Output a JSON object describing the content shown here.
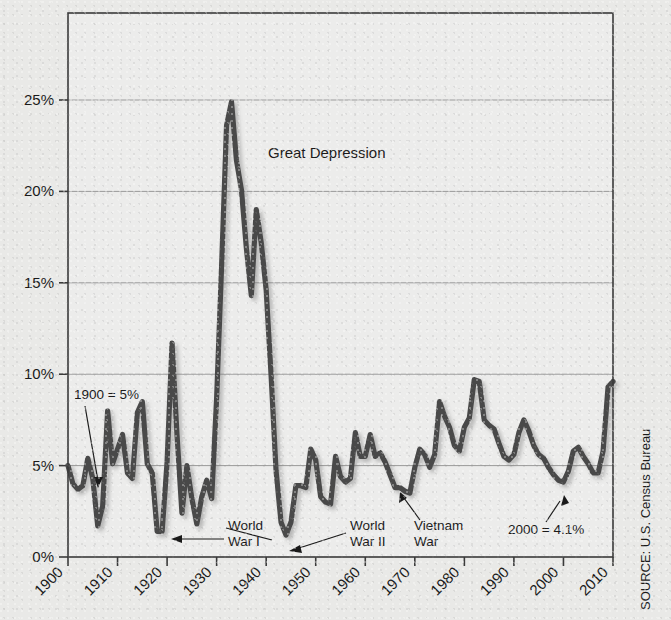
{
  "chart_data": {
    "type": "line",
    "title": "",
    "xlabel": "",
    "ylabel": "",
    "xlim": [
      1900,
      2010
    ],
    "ylim": [
      0,
      28.5
    ],
    "grid": true,
    "legend_position": "none",
    "y_tick_labels": [
      "0%",
      "5%",
      "10%",
      "15%",
      "20%",
      "25%"
    ],
    "y_tick_values": [
      0,
      5,
      10,
      15,
      20,
      25
    ],
    "x_tick_labels": [
      "1900",
      "1910",
      "1920",
      "1930",
      "1940",
      "1950",
      "1960",
      "1970",
      "1980",
      "1990",
      "2000",
      "2010"
    ],
    "x_tick_values": [
      1900,
      1910,
      1920,
      1930,
      1940,
      1950,
      1960,
      1970,
      1980,
      1990,
      2000,
      2010
    ],
    "series_name": "Unemployment rate",
    "series_color": "#4a4a4a",
    "x": [
      1900,
      1901,
      1902,
      1903,
      1904,
      1905,
      1906,
      1907,
      1908,
      1909,
      1910,
      1911,
      1912,
      1913,
      1914,
      1915,
      1916,
      1917,
      1918,
      1919,
      1920,
      1921,
      1922,
      1923,
      1924,
      1925,
      1926,
      1927,
      1928,
      1929,
      1930,
      1931,
      1932,
      1933,
      1934,
      1935,
      1936,
      1937,
      1938,
      1939,
      1940,
      1941,
      1942,
      1943,
      1944,
      1945,
      1946,
      1947,
      1948,
      1949,
      1950,
      1951,
      1952,
      1953,
      1954,
      1955,
      1956,
      1957,
      1958,
      1959,
      1960,
      1961,
      1962,
      1963,
      1964,
      1965,
      1966,
      1967,
      1968,
      1969,
      1970,
      1971,
      1972,
      1973,
      1974,
      1975,
      1976,
      1977,
      1978,
      1979,
      1980,
      1981,
      1982,
      1983,
      1984,
      1985,
      1986,
      1987,
      1988,
      1989,
      1990,
      1991,
      1992,
      1993,
      1994,
      1995,
      1996,
      1997,
      1998,
      1999,
      2000,
      2001,
      2002,
      2003,
      2004,
      2005,
      2006,
      2007,
      2008,
      2009,
      2010
    ],
    "values": [
      5.0,
      4.0,
      3.7,
      3.9,
      5.4,
      4.3,
      1.7,
      2.8,
      8.0,
      5.1,
      5.9,
      6.7,
      4.6,
      4.3,
      7.9,
      8.5,
      5.1,
      4.6,
      1.4,
      1.4,
      5.2,
      11.7,
      6.7,
      2.4,
      5.0,
      3.2,
      1.8,
      3.3,
      4.2,
      3.2,
      8.7,
      15.9,
      23.6,
      24.9,
      21.7,
      20.1,
      16.9,
      14.3,
      19.0,
      17.2,
      14.6,
      9.9,
      4.7,
      1.9,
      1.2,
      1.9,
      3.9,
      3.9,
      3.8,
      5.9,
      5.3,
      3.3,
      3.0,
      2.9,
      5.5,
      4.4,
      4.1,
      4.3,
      6.8,
      5.5,
      5.5,
      6.7,
      5.5,
      5.7,
      5.2,
      4.5,
      3.8,
      3.8,
      3.6,
      3.5,
      4.9,
      5.9,
      5.6,
      4.9,
      5.6,
      8.5,
      7.7,
      7.1,
      6.1,
      5.8,
      7.1,
      7.6,
      9.7,
      9.6,
      7.5,
      7.2,
      7.0,
      6.2,
      5.5,
      5.3,
      5.6,
      6.8,
      7.5,
      6.9,
      6.1,
      5.6,
      5.4,
      4.9,
      4.5,
      4.2,
      4.1,
      4.7,
      5.8,
      6.0,
      5.5,
      5.1,
      4.6,
      4.6,
      5.8,
      9.3,
      9.6
    ],
    "annotations": [
      {
        "name": "great-depression",
        "text": "Great Depression",
        "kind": "label"
      },
      {
        "name": "nineteen-hundred-value",
        "text": "1900 = 5%",
        "kind": "callout",
        "value": "5%",
        "year": 1900
      },
      {
        "name": "world-war-one",
        "text": "World\nWar I",
        "line1": "World",
        "line2": "War I",
        "kind": "callout"
      },
      {
        "name": "world-war-two",
        "text": "World\nWar II",
        "line1": "World",
        "line2": "War II",
        "kind": "callout"
      },
      {
        "name": "vietnam-war",
        "text": "Vietnam\nWar",
        "line1": "Vietnam",
        "line2": "War",
        "kind": "callout"
      },
      {
        "name": "two-thousand-value",
        "text": "2000 = 4.1%",
        "kind": "callout",
        "value": "4.1%",
        "year": 2000
      }
    ]
  },
  "source": {
    "label": "SOURCE: U.S. Census Bureau"
  },
  "colors": {
    "background": "#e9e9e7",
    "line": "#4a4a4a",
    "frame": "#3a3a3a",
    "grid": "#9a9a9a",
    "text": "#1a1a1a"
  }
}
